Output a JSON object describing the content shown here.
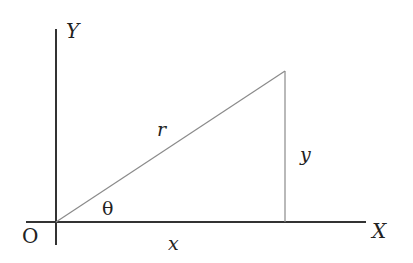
{
  "diagram": {
    "type": "polar-coordinate-triangle",
    "labels": {
      "y_axis": "Y",
      "x_axis": "X",
      "origin": "O",
      "hypotenuse": "r",
      "vertical_leg": "y",
      "horizontal_leg": "x",
      "angle": "θ"
    },
    "colors": {
      "axis": "#333333",
      "triangle": "#8a8a8a",
      "text": "#222222",
      "background": "#ffffff"
    }
  }
}
